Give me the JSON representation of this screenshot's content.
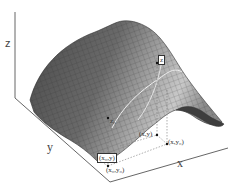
{
  "diagram": {
    "axes": {
      "z_label": "z",
      "y_label": "y",
      "x_label": "x"
    },
    "points": {
      "surface_point_label": "z",
      "surface_point_sub_label": "z₀",
      "xy_label": "(x,y)",
      "x_y0_label": "(x,y₀)",
      "x0_y_label": "(x₀,y)",
      "x0_y0_label": "(x₀,y₀)"
    },
    "colors": {
      "surface_dark": "#5a5a5a",
      "surface_light": "#b8b8b8",
      "mesh_line": "#2a2a2a",
      "axis": "#555555",
      "highlight_curve": "#f0f0f0"
    }
  }
}
